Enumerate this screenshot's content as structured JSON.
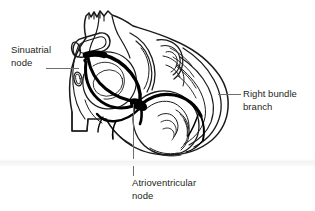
{
  "figure": {
    "style": "line drawing, black ink on white",
    "colors": {
      "background": "#ffffff",
      "outline": "#1a1a1a",
      "conduction_path": "#000000",
      "text": "#231f20",
      "leader_line": "#6e6e72",
      "baseline": "#f1f1f2"
    }
  },
  "labels": {
    "sinuatrial": {
      "line1": "Sinuatrial",
      "line2": "node",
      "full": "Sinuatrial node"
    },
    "right_bundle": {
      "line1": "Right bundle",
      "line2": "branch",
      "full": "Right bundle branch"
    },
    "atrioventricular": {
      "line1": "Atrioventricular",
      "line2": "node",
      "full": "Atrioventricular node"
    }
  }
}
